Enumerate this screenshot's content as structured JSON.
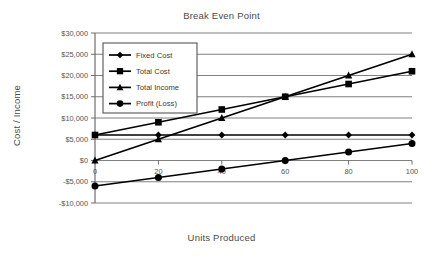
{
  "chart_data": {
    "type": "line",
    "title": "Break Even Point",
    "xlabel": "Units Produced",
    "ylabel": "Cost / Income",
    "x": [
      0,
      20,
      40,
      60,
      80,
      100
    ],
    "xticklabels": [
      "0",
      "20",
      "40",
      "60",
      "80",
      "100"
    ],
    "xlim": [
      0,
      100
    ],
    "ylim": [
      -10000,
      30000
    ],
    "yticks": [
      -10000,
      -5000,
      0,
      5000,
      10000,
      15000,
      20000,
      25000,
      30000
    ],
    "yticklabels": [
      "-$10,000",
      "-$5,000",
      "$0",
      "$5,000",
      "$10,000",
      "$15,000",
      "$20,000",
      "$25,000",
      "$30,000"
    ],
    "grid": "horizontal",
    "legend_position": "upper-left-inside",
    "series": [
      {
        "name": "Fixed Cost",
        "marker": "diamond",
        "color": "#000000",
        "values": [
          6000,
          6000,
          6000,
          6000,
          6000,
          6000
        ]
      },
      {
        "name": "Total Cost",
        "marker": "square",
        "color": "#000000",
        "values": [
          6000,
          9000,
          12000,
          15000,
          18000,
          21000
        ]
      },
      {
        "name": "Total Income",
        "marker": "triangle",
        "color": "#000000",
        "values": [
          0,
          5000,
          10000,
          15000,
          20000,
          25000
        ]
      },
      {
        "name": "Profit (Loss)",
        "marker": "circle",
        "color": "#000000",
        "values": [
          -6000,
          -4000,
          -2000,
          0,
          2000,
          4000
        ]
      }
    ],
    "annotations": []
  },
  "legend": {
    "items": [
      {
        "label": "Fixed Cost",
        "marker": "diamond"
      },
      {
        "label": "Total Cost",
        "marker": "square"
      },
      {
        "label": "Total Income",
        "marker": "triangle"
      },
      {
        "label": "Profit (Loss)",
        "marker": "circle"
      }
    ]
  },
  "colors": {
    "series": "#000000",
    "grid": "#808080",
    "axis": "#6e6e6e",
    "text": "#4a4a4a",
    "background": "#ffffff"
  }
}
